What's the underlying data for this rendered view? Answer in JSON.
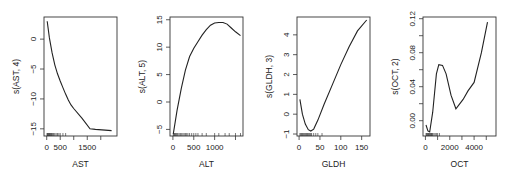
{
  "chart_data": [
    {
      "type": "line",
      "title": "",
      "xlabel": "AST",
      "ylabel": "s(AST, 4)",
      "xlim": [
        -100,
        2600
      ],
      "ylim": [
        -16.2,
        3.7
      ],
      "xticks": [
        0,
        500,
        1500
      ],
      "xtick_labels": [
        "0",
        "500",
        "1500"
      ],
      "minor_xticks": [
        1000,
        2000
      ],
      "yticks": [
        0,
        -5,
        -10,
        -15
      ],
      "ytick_labels": [
        "0",
        "-5",
        "-10",
        "-15"
      ],
      "grid": false,
      "x": [
        20,
        100,
        200,
        300,
        400,
        500,
        600,
        700,
        800,
        900,
        1000,
        1300,
        1600,
        1800,
        2400
      ],
      "y": [
        3,
        0.2,
        -2.3,
        -4.3,
        -5.8,
        -7.0,
        -8.1,
        -9.2,
        -10.2,
        -11.0,
        -11.6,
        -13.2,
        -15.0,
        -15.1,
        -15.3
      ],
      "rug": [
        10,
        30,
        50,
        70,
        90,
        110,
        130,
        150,
        180,
        200,
        230,
        260,
        300,
        350,
        400,
        450,
        500,
        600,
        700
      ]
    },
    {
      "type": "line",
      "title": "",
      "xlabel": "ALT",
      "ylabel": "s(ALT, 5)",
      "xlim": [
        -70,
        1680
      ],
      "ylim": [
        -6.2,
        15.5
      ],
      "xticks": [
        0,
        500,
        1000
      ],
      "xtick_labels": [
        "0",
        "500",
        "1000"
      ],
      "minor_xticks": [
        1500
      ],
      "yticks": [
        -5,
        0,
        5,
        10,
        15
      ],
      "ytick_labels": [
        "-5",
        "0",
        "5",
        "10",
        "15"
      ],
      "grid": false,
      "x": [
        10,
        100,
        200,
        300,
        400,
        500,
        600,
        700,
        800,
        900,
        1000,
        1100,
        1200,
        1300,
        1400,
        1500,
        1620
      ],
      "y": [
        -5.8,
        -1.5,
        2.5,
        5.8,
        8.3,
        9.8,
        11.0,
        12.2,
        13.2,
        14.0,
        14.4,
        14.5,
        14.5,
        14.2,
        13.5,
        12.8,
        12.1
      ],
      "rug": [
        10,
        25,
        40,
        60,
        80,
        100,
        120,
        150,
        180,
        210,
        240,
        270,
        300,
        330,
        360,
        400,
        450,
        500,
        550,
        600,
        700,
        800,
        1000,
        1100,
        1250,
        1350,
        1500,
        1620
      ]
    },
    {
      "type": "line",
      "title": "",
      "xlabel": "GLDH",
      "ylabel": "s(GLDH, 3)",
      "xlim": [
        -5,
        170
      ],
      "ylim": [
        -1.1,
        4.9
      ],
      "xticks": [
        0,
        50,
        100,
        150
      ],
      "xtick_labels": [
        "0",
        "50",
        "100",
        "150"
      ],
      "yticks": [
        -1,
        0,
        1,
        2,
        3,
        4
      ],
      "ytick_labels": [
        "-1",
        "0",
        "1",
        "2",
        "3",
        "4"
      ],
      "grid": false,
      "x": [
        2,
        8,
        15,
        22,
        28,
        35,
        45,
        60,
        80,
        100,
        120,
        140,
        162
      ],
      "y": [
        0.75,
        0.0,
        -0.5,
        -0.78,
        -0.85,
        -0.75,
        -0.3,
        0.5,
        1.5,
        2.5,
        3.4,
        4.2,
        4.75
      ],
      "rug": [
        2,
        4,
        6,
        8,
        10,
        12,
        14,
        16,
        18,
        20,
        22,
        24,
        26,
        28,
        30,
        35,
        40,
        45,
        55
      ]
    },
    {
      "type": "line",
      "title": "",
      "xlabel": "OCT",
      "ylabel": "s(OCT, 2)",
      "xlim": [
        -200,
        5800
      ],
      "ylim": [
        -0.018,
        0.122
      ],
      "xticks": [
        0,
        2000,
        4000
      ],
      "xtick_labels": [
        "0",
        "2000",
        "4000"
      ],
      "minor_xticks": [
        1000,
        3000,
        5000
      ],
      "yticks": [
        0.0,
        0.04,
        0.08,
        0.12
      ],
      "ytick_labels": [
        "0.00",
        "0.04",
        "0.08",
        "0.12"
      ],
      "minor_yticks": [
        0.02,
        0.06,
        0.1
      ],
      "grid": false,
      "x": [
        50,
        200,
        350,
        600,
        900,
        1100,
        1400,
        1700,
        2100,
        2500,
        3100,
        3500,
        4000,
        4600,
        5100
      ],
      "y": [
        -0.005,
        -0.012,
        -0.013,
        0.01,
        0.055,
        0.066,
        0.065,
        0.055,
        0.03,
        0.014,
        0.025,
        0.035,
        0.045,
        0.08,
        0.116
      ],
      "rug": [
        50,
        100,
        150,
        200,
        250,
        300,
        350,
        400,
        450,
        500,
        550,
        600,
        700,
        800,
        900,
        1000,
        1150
      ]
    }
  ]
}
